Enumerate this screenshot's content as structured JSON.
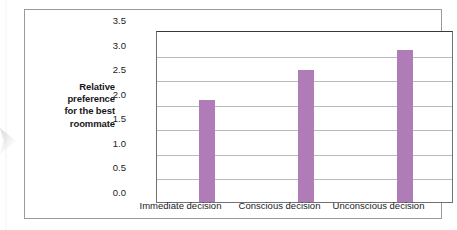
{
  "chart_data": {
    "type": "bar",
    "title": "",
    "xlabel": "",
    "ylabel": "Relative preference for the best roommate",
    "ylabel_lines": [
      "Relative",
      "preference",
      "for the best",
      "roommate"
    ],
    "categories": [
      "Immediate decision",
      "Conscious decision",
      "Unconscious decision"
    ],
    "values": [
      2.07,
      2.68,
      3.1
    ],
    "ylim": [
      0.0,
      3.5
    ],
    "ytick_labels": [
      "3.5",
      "3.0",
      "2.5",
      "2.0",
      "1.5",
      "1.0",
      "0.5",
      "0.0"
    ],
    "ytick_values": [
      3.5,
      3.0,
      2.5,
      2.0,
      1.5,
      1.0,
      0.5,
      0.0
    ],
    "grid": true,
    "legend": "none",
    "bar_color": "#b07cb8",
    "gridline_color": "#b9b9be",
    "axis_color": "#6f6f74",
    "background": "#ffffff"
  }
}
